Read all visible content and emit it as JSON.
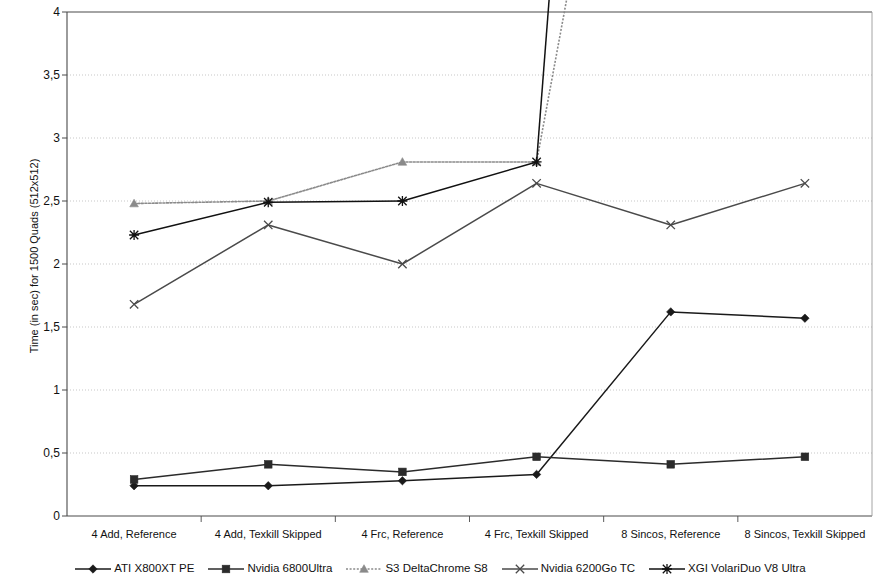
{
  "chart_data": {
    "type": "line",
    "title": "",
    "xlabel": "",
    "ylabel": "Time (in sec) for 1500 Quads (512x512)",
    "ylim": [
      0,
      4
    ],
    "ytick_step": 0.5,
    "ytick_labels": [
      "0",
      "0,5",
      "1",
      "1,5",
      "2",
      "2,5",
      "3",
      "3,5",
      "4"
    ],
    "decimal_separator": ",",
    "grid": true,
    "legend_position": "bottom",
    "categories": [
      "4 Add, Reference",
      "4 Add, Texkill Skipped",
      "4 Frc, Reference",
      "4 Frc, Texkill Skipped",
      "8 Sincos, Reference",
      "8 Sincos, Texkill Skipped"
    ],
    "series": [
      {
        "name": "ATI X800XT PE",
        "marker": "diamond",
        "color": "#1a1a1a",
        "style": "solid",
        "values": [
          0.24,
          0.24,
          0.28,
          0.33,
          1.62,
          1.57
        ]
      },
      {
        "name": "Nvidia 6800Ultra",
        "marker": "square",
        "color": "#2b2b2b",
        "style": "solid",
        "values": [
          0.29,
          0.41,
          0.35,
          0.47,
          0.41,
          0.47
        ]
      },
      {
        "name": "S3 DeltaChrome S8",
        "marker": "triangle",
        "color": "#8a8a8a",
        "style": "dotted",
        "values": [
          2.48,
          2.5,
          2.81,
          2.81,
          null,
          null
        ],
        "note": "rises off-scale above 4 after 4 Frc, Texkill Skipped"
      },
      {
        "name": "Nvidia 6200Go TC",
        "marker": "cross",
        "color": "#4a4a4a",
        "style": "solid",
        "values": [
          1.68,
          2.31,
          2.0,
          2.64,
          2.31,
          2.64
        ]
      },
      {
        "name": "XGI VolariDuo V8 Ultra",
        "marker": "asterisk",
        "color": "#111111",
        "style": "solid",
        "values": [
          2.23,
          2.49,
          2.5,
          2.81,
          null,
          null
        ],
        "note": "rises off-scale above 4 after 4 Frc, Texkill Skipped"
      }
    ]
  },
  "axis": {
    "y_title": "Time (in sec) for 1500 Quads (512x512)"
  },
  "legend": {
    "items": [
      {
        "label": "ATI X800XT PE",
        "marker": "diamond-marker"
      },
      {
        "label": "Nvidia 6800Ultra",
        "marker": "square-marker"
      },
      {
        "label": "S3 DeltaChrome S8",
        "marker": "triangle-marker"
      },
      {
        "label": "Nvidia 6200Go TC",
        "marker": "cross-marker"
      },
      {
        "label": "XGI VolariDuo V8 Ultra",
        "marker": "asterisk-marker"
      }
    ]
  }
}
